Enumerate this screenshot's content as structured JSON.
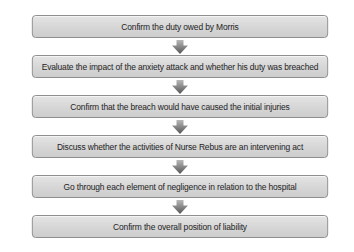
{
  "flowchart": {
    "steps": [
      {
        "label": "Confirm the duty owed by Morris"
      },
      {
        "label": "Evaluate the impact of the anxiety attack and whether his duty was breached"
      },
      {
        "label": "Confirm that the breach would have caused the initial injuries"
      },
      {
        "label": "Discuss whether the activities of Nurse Rebus are an intervening act"
      },
      {
        "label": "Go through each element of negligence in relation to the hospital"
      },
      {
        "label": "Confirm the overall position of liability"
      }
    ],
    "connector_icon": "down-arrow-icon",
    "colors": {
      "box_fill": "#d9d9d9",
      "box_border": "#8a8a8a",
      "arrow_top": "#b0b0b0",
      "arrow_bottom": "#5a5a5a",
      "text": "#1e1e1e"
    }
  }
}
